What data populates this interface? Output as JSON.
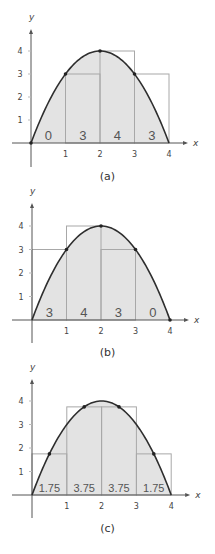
{
  "colors": {
    "curve": "#2e2e2e",
    "fill": "#e3e3e3",
    "rect_stroke": "#a8a8a8",
    "axis": "#555555",
    "text": "#444444",
    "point": "#222222"
  },
  "function": "f(x) = 4x - x^2",
  "chart_data": [
    {
      "type": "area",
      "title": "(a)",
      "xlabel": "x",
      "ylabel": "y",
      "x_ticks": [
        1,
        2,
        3,
        4
      ],
      "y_ticks": [
        1,
        2,
        3,
        4
      ],
      "xlim": [
        0,
        4
      ],
      "ylim": [
        0,
        4
      ],
      "rule": "left endpoint",
      "rect_heights": [
        0,
        3,
        4,
        3
      ],
      "rect_labels": [
        "0",
        "3",
        "4",
        "3"
      ],
      "sample_points": [
        [
          0,
          0
        ],
        [
          1,
          3
        ],
        [
          2,
          4
        ],
        [
          3,
          3
        ]
      ]
    },
    {
      "type": "area",
      "title": "(b)",
      "xlabel": "x",
      "ylabel": "y",
      "x_ticks": [
        1,
        2,
        3,
        4
      ],
      "y_ticks": [
        1,
        2,
        3,
        4
      ],
      "xlim": [
        0,
        4
      ],
      "ylim": [
        0,
        4
      ],
      "rule": "right endpoint",
      "rect_heights": [
        3,
        4,
        3,
        0
      ],
      "rect_labels": [
        "3",
        "4",
        "3",
        "0"
      ],
      "sample_points": [
        [
          1,
          3
        ],
        [
          2,
          4
        ],
        [
          3,
          3
        ],
        [
          4,
          0
        ]
      ]
    },
    {
      "type": "area",
      "title": "(c)",
      "xlabel": "x",
      "ylabel": "y",
      "x_ticks": [
        1,
        2,
        3,
        4
      ],
      "y_ticks": [
        1,
        2,
        3,
        4
      ],
      "xlim": [
        0,
        4
      ],
      "ylim": [
        0,
        4
      ],
      "rule": "midpoint",
      "rect_heights": [
        1.75,
        3.75,
        3.75,
        1.75
      ],
      "rect_labels": [
        "1.75",
        "3.75",
        "3.75",
        "1.75"
      ],
      "sample_points": [
        [
          0.5,
          1.75
        ],
        [
          1.5,
          3.75
        ],
        [
          2.5,
          3.75
        ],
        [
          3.5,
          1.75
        ]
      ]
    }
  ],
  "panels": [
    {
      "caption": "(a)"
    },
    {
      "caption": "(b)"
    },
    {
      "caption": "(c)"
    }
  ]
}
